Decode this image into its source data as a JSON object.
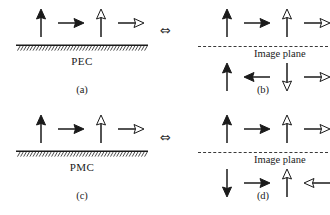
{
  "figure": {
    "equivalence_symbol": "⇔",
    "panels": [
      {
        "id": "a",
        "caption": "(a)",
        "boundary_label": "PEC",
        "boundary_type": "hatched-ground-plane",
        "rows": [
          {
            "position": "above",
            "arrows": [
              {
                "name": "solid-up-arrow",
                "direction": "up",
                "fill": "solid"
              },
              {
                "name": "solid-right-arrow",
                "direction": "right",
                "fill": "solid"
              },
              {
                "name": "hollow-up-arrow",
                "direction": "up",
                "fill": "hollow"
              },
              {
                "name": "hollow-right-arrow",
                "direction": "right",
                "fill": "hollow"
              }
            ]
          }
        ]
      },
      {
        "id": "b",
        "caption": "(b)",
        "boundary_label": "Image plane",
        "boundary_type": "dashed-image-plane",
        "rows": [
          {
            "position": "above",
            "arrows": [
              {
                "name": "solid-up-arrow",
                "direction": "up",
                "fill": "solid"
              },
              {
                "name": "solid-right-arrow",
                "direction": "right",
                "fill": "solid"
              },
              {
                "name": "hollow-up-arrow",
                "direction": "up",
                "fill": "hollow"
              },
              {
                "name": "hollow-right-arrow",
                "direction": "right",
                "fill": "hollow"
              }
            ]
          },
          {
            "position": "below",
            "arrows": [
              {
                "name": "solid-up-arrow",
                "direction": "up",
                "fill": "solid"
              },
              {
                "name": "solid-left-arrow",
                "direction": "left",
                "fill": "solid"
              },
              {
                "name": "hollow-down-arrow",
                "direction": "down",
                "fill": "hollow"
              },
              {
                "name": "hollow-right-arrow",
                "direction": "right",
                "fill": "hollow"
              }
            ]
          }
        ]
      },
      {
        "id": "c",
        "caption": "(c)",
        "boundary_label": "PMC",
        "boundary_type": "hatched-ground-plane",
        "rows": [
          {
            "position": "above",
            "arrows": [
              {
                "name": "solid-up-arrow",
                "direction": "up",
                "fill": "solid"
              },
              {
                "name": "solid-right-arrow",
                "direction": "right",
                "fill": "solid"
              },
              {
                "name": "hollow-up-arrow",
                "direction": "up",
                "fill": "hollow"
              },
              {
                "name": "hollow-right-arrow",
                "direction": "right",
                "fill": "hollow"
              }
            ]
          }
        ]
      },
      {
        "id": "d",
        "caption": "(d)",
        "boundary_label": "Image plane",
        "boundary_type": "dashed-image-plane",
        "rows": [
          {
            "position": "above",
            "arrows": [
              {
                "name": "solid-up-arrow",
                "direction": "up",
                "fill": "solid"
              },
              {
                "name": "solid-right-arrow",
                "direction": "right",
                "fill": "solid"
              },
              {
                "name": "hollow-up-arrow",
                "direction": "up",
                "fill": "hollow"
              },
              {
                "name": "hollow-right-arrow",
                "direction": "right",
                "fill": "hollow"
              }
            ]
          },
          {
            "position": "below",
            "arrows": [
              {
                "name": "solid-down-arrow",
                "direction": "down",
                "fill": "solid"
              },
              {
                "name": "solid-right-arrow",
                "direction": "right",
                "fill": "solid"
              },
              {
                "name": "hollow-up-arrow",
                "direction": "up",
                "fill": "hollow"
              },
              {
                "name": "hollow-left-arrow",
                "direction": "left",
                "fill": "hollow"
              }
            ]
          }
        ]
      }
    ],
    "colors": {
      "ink": "#1a1a1a",
      "background": "#ffffff",
      "hollow_fill": "#ffffff"
    }
  }
}
